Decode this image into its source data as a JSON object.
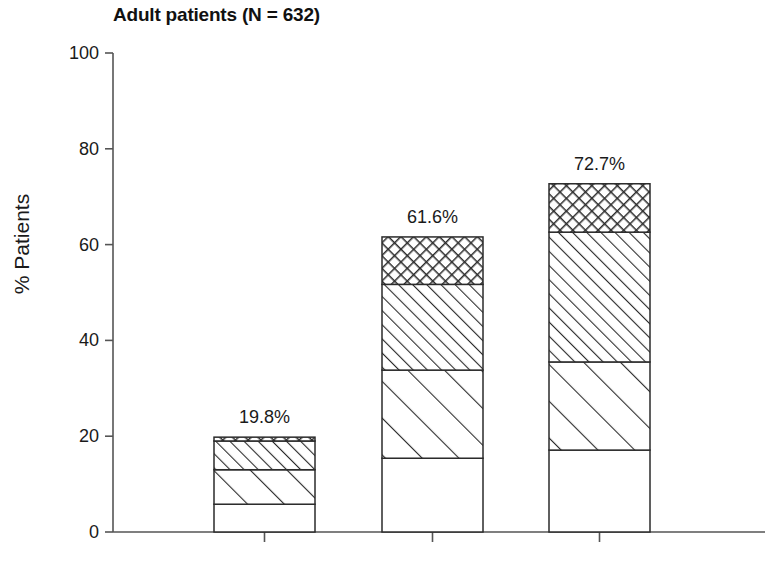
{
  "chart_data": {
    "type": "bar",
    "subtype": "stacked-bar",
    "title": "Adult patients (N = 632)",
    "xlabel": "",
    "ylabel": "% Patients",
    "ylim": [
      0,
      100
    ],
    "yticks": [
      0,
      20,
      40,
      60,
      80,
      100
    ],
    "ytick_labels": [
      "0",
      "20",
      "40",
      "60",
      "80",
      "100"
    ],
    "xtick_labels": [
      "",
      "",
      ""
    ],
    "grid": false,
    "legend": null,
    "categories": [
      "Group 1",
      "Group 2",
      "Group 3"
    ],
    "totals": [
      19.8,
      61.6,
      72.7
    ],
    "total_labels": [
      "19.8%",
      "61.6%",
      "72.7%"
    ],
    "series": [
      {
        "name": "segment-1",
        "pattern": "solid-white",
        "values": [
          5.8,
          15.4,
          17.1
        ]
      },
      {
        "name": "segment-2",
        "pattern": "diagonal-wide",
        "values": [
          7.2,
          18.4,
          18.4
        ]
      },
      {
        "name": "segment-3",
        "pattern": "diagonal-narrow",
        "values": [
          6.0,
          17.9,
          27.1
        ]
      },
      {
        "name": "segment-4",
        "pattern": "crosshatch",
        "values": [
          0.8,
          9.9,
          10.1
        ]
      }
    ],
    "cumulative_tops": [
      [
        5.8,
        13.0,
        19.0,
        19.8
      ],
      [
        15.4,
        33.8,
        51.7,
        61.6
      ],
      [
        17.1,
        35.5,
        62.6,
        72.7
      ]
    ]
  },
  "colors": {
    "axis": "#555555",
    "outline": "#2b2b2b",
    "text": "#1a1a1a",
    "background": "#ffffff",
    "fill": "#ffffff"
  },
  "geometry": {
    "axis_x": 113,
    "axis_top_y": 53,
    "axis_bottom_y": 532,
    "axis_right_x": 765,
    "bar_lefts": [
      214,
      382,
      549
    ],
    "bar_width": 101
  }
}
